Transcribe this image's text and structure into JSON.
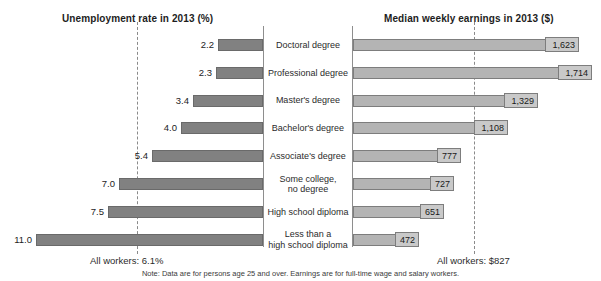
{
  "titles": {
    "left": "Unemployment rate in 2013 (%)",
    "right": "Median weekly earnings in 2013 ($)"
  },
  "footnotes": {
    "all_workers_left": "All workers: 6.1%",
    "all_workers_right": "All workers: $827",
    "note": "Note: Data are for persons age 25 and over. Earnings are for full-time wage and salary workers."
  },
  "colors": {
    "bar_left": "#818181",
    "bar_right": "#b4b4b4",
    "label_box": "#c9c9c9",
    "axis": "#8e8e8e",
    "reference_line": "#8a8a8a"
  },
  "chart_data": {
    "type": "bar",
    "orientation": "horizontal",
    "layout": "bidirectional-tornado",
    "categories": [
      "Doctoral degree",
      "Professional degree",
      "Master's degree",
      "Bachelor's degree",
      "Associate's degree",
      "Some college, no degree",
      "High school diploma",
      "Less than a high school diploma"
    ],
    "category_lines": [
      [
        "Doctoral degree"
      ],
      [
        "Professional degree"
      ],
      [
        "Master's degree"
      ],
      [
        "Bachelor's degree"
      ],
      [
        "Associate's degree"
      ],
      [
        "Some college,",
        "no degree"
      ],
      [
        "High school diploma"
      ],
      [
        "Less than a",
        "high school diploma"
      ]
    ],
    "series": [
      {
        "name": "Unemployment rate in 2013 (%)",
        "side": "left",
        "unit": "%",
        "values": [
          2.2,
          2.3,
          3.4,
          4.0,
          5.4,
          7.0,
          7.5,
          11.0
        ],
        "labels": [
          "2.2",
          "2.3",
          "3.4",
          "4.0",
          "5.4",
          "7.0",
          "7.5",
          "11.0"
        ],
        "axis_max": 11.0,
        "reference_value": 6.1,
        "reference_label": "All workers: 6.1%"
      },
      {
        "name": "Median weekly earnings in 2013 ($)",
        "side": "right",
        "unit": "$",
        "values": [
          1623,
          1714,
          1329,
          1108,
          777,
          727,
          651,
          472
        ],
        "labels": [
          "1,623",
          "1,714",
          "1,329",
          "1,108",
          "777",
          "727",
          "651",
          "472"
        ],
        "axis_max": 1714,
        "reference_value": 827,
        "reference_label": "All workers: $827"
      }
    ],
    "grid": false,
    "legend": "none"
  }
}
